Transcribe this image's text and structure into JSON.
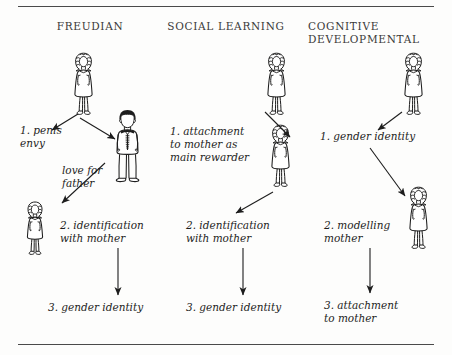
{
  "figure": {
    "columns": [
      {
        "id": "freudian",
        "header": "FREUDIAN",
        "steps": [
          {
            "id": "penis-envy",
            "text": "1.  penis\n     envy"
          },
          {
            "id": "love-for-father",
            "text": "love for\nfather"
          },
          {
            "id": "identification-with-mother",
            "text": "2.  identification\n     with mother"
          },
          {
            "id": "gender-identity",
            "text": "3. gender identity"
          }
        ],
        "people": [
          {
            "id": "mother-top",
            "type": "woman-dress"
          },
          {
            "id": "father",
            "type": "man-suit"
          },
          {
            "id": "girl",
            "type": "girl-dress"
          }
        ]
      },
      {
        "id": "social-learning",
        "header": "SOCIAL  LEARNING",
        "steps": [
          {
            "id": "attachment-to-mother",
            "text": "1.  attachment\n     to mother as\n     main rewarder"
          },
          {
            "id": "identification-with-mother",
            "text": "2.  identification\n     with mother"
          },
          {
            "id": "gender-identity",
            "text": "3. gender identity"
          }
        ],
        "people": [
          {
            "id": "mother-top",
            "type": "woman-dress"
          },
          {
            "id": "mother-middle",
            "type": "woman-dress"
          }
        ]
      },
      {
        "id": "cognitive-developmental",
        "header": "COGNITIVE\nDEVELOPMENTAL",
        "steps": [
          {
            "id": "gender-identity",
            "text": "1.  gender identity"
          },
          {
            "id": "modelling-mother",
            "text": "2.  modelling\n     mother"
          },
          {
            "id": "attachment-to-mother",
            "text": "3.  attachment\n     to mother"
          }
        ],
        "people": [
          {
            "id": "mother-top",
            "type": "woman-dress"
          },
          {
            "id": "mother-middle",
            "type": "woman-dress"
          }
        ]
      }
    ],
    "colors": {
      "ink": "#1d1d1d",
      "header_ink": "#3a3a3a",
      "rule": "#4a4a4a",
      "paper": "#fdfdfc"
    }
  }
}
